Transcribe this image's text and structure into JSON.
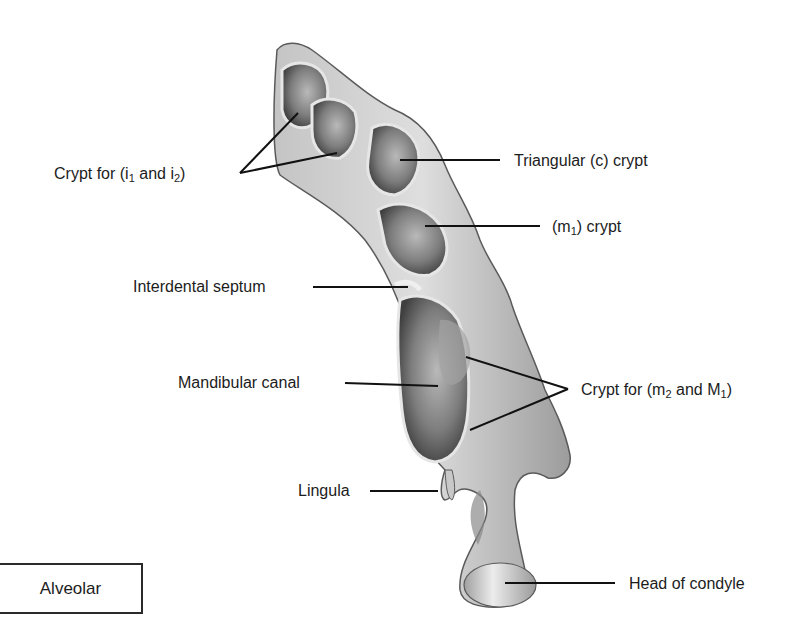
{
  "figure": {
    "title_box": "Alveolar",
    "labels": {
      "crypt_i1_i2": {
        "prefix": "Crypt for (i",
        "sub1": "1",
        "mid": " and i",
        "sub2": "2",
        "suffix": ")"
      },
      "triangular_crypt": "Triangular (c) crypt",
      "m1_crypt": {
        "prefix": "(m",
        "sub1": "1",
        "suffix": ") crypt"
      },
      "interdental_septum": "Interdental septum",
      "mandibular_canal": "Mandibular canal",
      "crypt_m2_M1": {
        "prefix": "Crypt for (m",
        "sub1": "2",
        "mid": " and M",
        "sub2": "1",
        "suffix": ")"
      },
      "lingula": "Lingula",
      "head_of_condyle": "Head of condyle"
    },
    "colors": {
      "background": "#ffffff",
      "bone_light": "#d9d9d9",
      "bone_mid": "#a8a8a8",
      "crypt_dark": "#5a5a5a",
      "leader_line": "#111111"
    }
  }
}
